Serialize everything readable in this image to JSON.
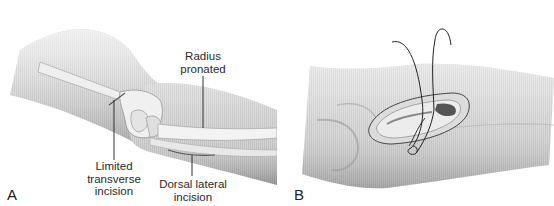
{
  "figure": {
    "panels": [
      {
        "id": "A",
        "letter": "A",
        "labels": {
          "radius_line1": "Radius",
          "radius_line2": "pronated",
          "limited_line1": "Limited",
          "limited_line2": "transverse",
          "limited_line3": "incision",
          "dorsal_line1": "Dorsal lateral",
          "dorsal_line2": "incision"
        }
      },
      {
        "id": "B",
        "letter": "B"
      }
    ],
    "colors": {
      "background": "#ffffff",
      "skin_light": "#e6e6e6",
      "skin_mid": "#bdbdbd",
      "skin_dark": "#8f8f8f",
      "bone": "#f2f2f2",
      "line": "#333333"
    }
  }
}
